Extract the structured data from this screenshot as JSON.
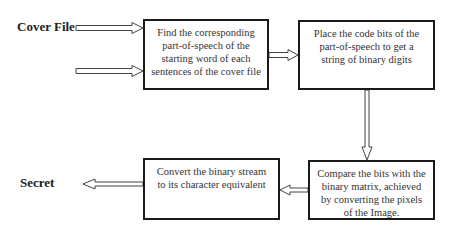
{
  "diagram": {
    "inputs": {
      "cover_file_label": "Cover File",
      "secret_label": "Secret"
    },
    "nodes": [
      {
        "id": "find-pos",
        "text": "Find the corresponding part-of-speech of the starting word of each sentences of the cover file"
      },
      {
        "id": "place-bits",
        "text": "Place the code bits of the part-of-speech to get a string of binary digits"
      },
      {
        "id": "compare-bits",
        "text": "Compare the bits with the binary matrix, achieved by converting the pixels of the Image."
      },
      {
        "id": "convert-stream",
        "text": "Convert the binary stream to its character equivalent"
      }
    ],
    "edges": [
      {
        "from": "cover-file",
        "to": "find-pos"
      },
      {
        "from": "unlabeled-input",
        "to": "find-pos"
      },
      {
        "from": "find-pos",
        "to": "place-bits"
      },
      {
        "from": "place-bits",
        "to": "compare-bits"
      },
      {
        "from": "compare-bits",
        "to": "convert-stream"
      },
      {
        "from": "convert-stream",
        "to": "secret"
      }
    ]
  }
}
